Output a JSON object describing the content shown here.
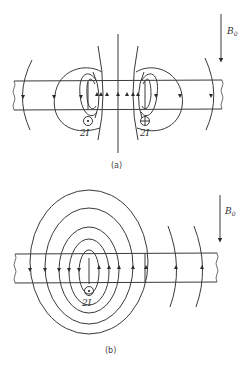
{
  "figure": {
    "panel_a": {
      "caption": "(a)",
      "field_label": "B",
      "field_subscript": "0",
      "currents": [
        {
          "symbol": "dot",
          "label": "2I"
        },
        {
          "symbol": "cross",
          "label": "2I"
        }
      ]
    },
    "panel_b": {
      "caption": "(b)",
      "field_label": "B",
      "field_subscript": "0",
      "currents": [
        {
          "symbol": "dot",
          "label": "2I"
        }
      ]
    }
  }
}
